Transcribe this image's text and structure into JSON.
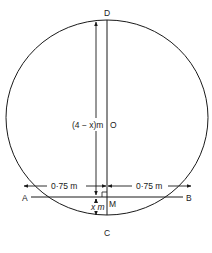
{
  "diagram": {
    "type": "geometry",
    "points": {
      "D": "D",
      "O": "O",
      "A": "A",
      "B": "B",
      "M": "M",
      "C": "C"
    },
    "labels": {
      "upper_segment": "(4 − x)m",
      "lower_segment": "x m",
      "left_half_chord": "0·75 m",
      "right_half_chord": "0·75 m"
    },
    "colors": {
      "stroke": "#1a1a1a",
      "background": "#ffffff"
    }
  }
}
